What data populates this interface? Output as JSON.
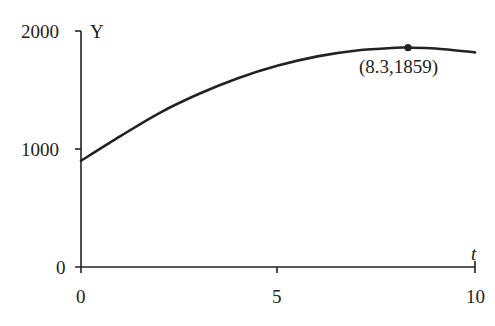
{
  "chart_data": {
    "type": "line",
    "title": "",
    "xlabel": "t",
    "ylabel": "Y",
    "xlim": [
      0,
      10
    ],
    "ylim": [
      0,
      2000
    ],
    "x_ticks": [
      0,
      5,
      10
    ],
    "y_ticks": [
      0,
      1000,
      2000
    ],
    "x_tick_labels": [
      "0",
      "5",
      "10"
    ],
    "y_tick_labels": [
      "0",
      "1000",
      "2000"
    ],
    "grid": false,
    "legend": null,
    "series": [
      {
        "name": "Y(t)",
        "description": "concave-down curve rising from about 900 at t=0 to a maximum at t=8.3, then slightly decreasing",
        "x": [
          0,
          1,
          2,
          3,
          4,
          5,
          6,
          7,
          8,
          8.3,
          9,
          10
        ],
        "values": [
          900,
          1109,
          1307,
          1468,
          1602,
          1707,
          1785,
          1835,
          1858,
          1859,
          1852,
          1819
        ]
      }
    ],
    "annotations": [
      {
        "type": "point",
        "x": 8.3,
        "y": 1859,
        "label": "(8.3,1859)"
      }
    ]
  },
  "labels": {
    "y_axis": "Y",
    "x_axis": "t",
    "y_tick_0": "0",
    "y_tick_1000": "1000",
    "y_tick_2000": "2000",
    "x_tick_0": "0",
    "x_tick_5": "5",
    "x_tick_10": "10",
    "max_point": "(8.3,1859)"
  },
  "colors": {
    "ink": "#222222",
    "background": "#ffffff"
  }
}
